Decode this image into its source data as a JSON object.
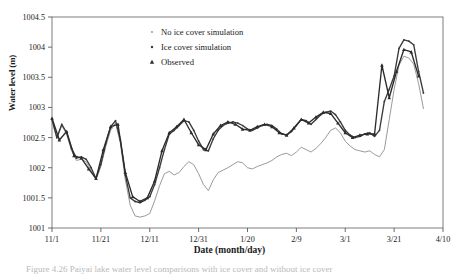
{
  "figure": {
    "caption": "Figure 4.26 Paiyai lake water level comparisons with ice cover and without ice cover"
  },
  "chart_data": {
    "type": "line",
    "title": "",
    "xlabel": "Date (month/day)",
    "ylabel": "Water level (m)",
    "ylim": [
      1001,
      1004.5
    ],
    "yticks": [
      1001,
      1001.5,
      1002,
      1002.5,
      1003,
      1003.5,
      1004,
      1004.5
    ],
    "ytick_labels": [
      "1001",
      "1001.5",
      "1002",
      "1002.5",
      "1003",
      "1003.5",
      "1004",
      "1004.5"
    ],
    "xlim": [
      0,
      160
    ],
    "xticks": [
      0,
      20,
      40,
      60,
      80,
      100,
      120,
      140,
      160
    ],
    "xtick_labels": [
      "11/1",
      "11/21",
      "12/11",
      "12/31",
      "1/20",
      "2/9",
      "3/1",
      "3/21",
      "4/10"
    ],
    "grid": false,
    "legend_position": "upper-center-left",
    "series": [
      {
        "name": "No ice cover simulation",
        "marker": "dot",
        "color": "#9a9a9a",
        "x": [
          0,
          2,
          4,
          6,
          8,
          10,
          12,
          14,
          16,
          18,
          20,
          22,
          24,
          26,
          28,
          30,
          32,
          34,
          36,
          38,
          40,
          42,
          44,
          46,
          48,
          50,
          52,
          54,
          56,
          58,
          60,
          62,
          64,
          66,
          68,
          70,
          72,
          74,
          76,
          78,
          80,
          82,
          84,
          86,
          88,
          90,
          92,
          94,
          96,
          98,
          100,
          102,
          104,
          106,
          108,
          110,
          112,
          114,
          116,
          118,
          120,
          122,
          124,
          126,
          128,
          130,
          132,
          134,
          136,
          138,
          140,
          142,
          144,
          146,
          148,
          150,
          152
        ],
        "values": [
          1002.78,
          1002.48,
          1002.7,
          1002.55,
          1002.28,
          1002.12,
          1002.14,
          1002.1,
          1001.95,
          1001.8,
          1002.02,
          1002.35,
          1002.62,
          1002.74,
          1002.4,
          1001.8,
          1001.38,
          1001.2,
          1001.18,
          1001.2,
          1001.24,
          1001.45,
          1001.7,
          1001.9,
          1001.94,
          1001.88,
          1001.92,
          1002.02,
          1002.1,
          1002.05,
          1001.9,
          1001.72,
          1001.62,
          1001.8,
          1001.92,
          1001.96,
          1002.0,
          1002.05,
          1002.1,
          1002.08,
          1002.0,
          1001.98,
          1002.02,
          1002.05,
          1002.08,
          1002.12,
          1002.18,
          1002.22,
          1002.24,
          1002.2,
          1002.26,
          1002.34,
          1002.3,
          1002.26,
          1002.32,
          1002.4,
          1002.5,
          1002.62,
          1002.66,
          1002.58,
          1002.44,
          1002.36,
          1002.3,
          1002.28,
          1002.26,
          1002.28,
          1002.22,
          1002.18,
          1002.3,
          1002.8,
          1003.3,
          1003.7,
          1003.85,
          1003.82,
          1003.72,
          1003.4,
          1002.98
        ]
      },
      {
        "name": "Ice cover simulation",
        "marker": "dot",
        "color": "#3a3a3a",
        "x": [
          0,
          2,
          4,
          6,
          8,
          10,
          12,
          14,
          16,
          18,
          20,
          22,
          24,
          26,
          28,
          30,
          32,
          34,
          36,
          38,
          40,
          42,
          44,
          46,
          48,
          50,
          52,
          54,
          56,
          58,
          60,
          62,
          64,
          66,
          68,
          70,
          72,
          74,
          76,
          78,
          80,
          82,
          84,
          86,
          88,
          90,
          92,
          94,
          96,
          98,
          100,
          102,
          104,
          106,
          108,
          110,
          112,
          114,
          116,
          118,
          120,
          122,
          124,
          126,
          128,
          130,
          132,
          134,
          136,
          138,
          140,
          142,
          144,
          146,
          148,
          150,
          152
        ],
        "values": [
          1002.8,
          1002.5,
          1002.72,
          1002.58,
          1002.32,
          1002.16,
          1002.18,
          1002.14,
          1002.0,
          1001.82,
          1002.06,
          1002.4,
          1002.68,
          1002.78,
          1002.46,
          1001.88,
          1001.5,
          1001.44,
          1001.42,
          1001.46,
          1001.52,
          1001.72,
          1002.0,
          1002.3,
          1002.56,
          1002.62,
          1002.7,
          1002.78,
          1002.76,
          1002.62,
          1002.44,
          1002.3,
          1002.28,
          1002.48,
          1002.62,
          1002.7,
          1002.74,
          1002.76,
          1002.74,
          1002.7,
          1002.64,
          1002.62,
          1002.66,
          1002.7,
          1002.72,
          1002.7,
          1002.64,
          1002.56,
          1002.54,
          1002.6,
          1002.7,
          1002.8,
          1002.78,
          1002.72,
          1002.8,
          1002.88,
          1002.92,
          1002.94,
          1002.88,
          1002.76,
          1002.62,
          1002.54,
          1002.5,
          1002.52,
          1002.56,
          1002.58,
          1002.52,
          1002.62,
          1003.1,
          1003.3,
          1003.52,
          1003.98,
          1004.12,
          1004.1,
          1004.04,
          1003.6,
          1003.24
        ]
      },
      {
        "name": "Observed",
        "marker": "triangle",
        "color": "#2b2b2b",
        "x": [
          0,
          3,
          6,
          9,
          12,
          15,
          18,
          21,
          24,
          27,
          30,
          33,
          36,
          39,
          42,
          45,
          48,
          51,
          54,
          57,
          60,
          63,
          66,
          69,
          72,
          75,
          78,
          81,
          84,
          87,
          90,
          93,
          96,
          99,
          102,
          105,
          108,
          111,
          114,
          117,
          120,
          123,
          126,
          129,
          132,
          135,
          138,
          141,
          144,
          147,
          150
        ],
        "values": [
          1002.82,
          1002.46,
          1002.6,
          1002.2,
          1002.16,
          1001.98,
          1001.82,
          1002.3,
          1002.68,
          1002.72,
          1001.92,
          1001.52,
          1001.44,
          1001.5,
          1001.78,
          1002.28,
          1002.58,
          1002.68,
          1002.8,
          1002.58,
          1002.38,
          1002.3,
          1002.56,
          1002.7,
          1002.76,
          1002.72,
          1002.64,
          1002.62,
          1002.68,
          1002.72,
          1002.68,
          1002.58,
          1002.54,
          1002.66,
          1002.8,
          1002.74,
          1002.84,
          1002.92,
          1002.9,
          1002.74,
          1002.58,
          1002.5,
          1002.54,
          1002.56,
          1002.56,
          1003.7,
          1003.16,
          1003.6,
          1003.96,
          1003.92,
          1003.52
        ]
      }
    ]
  }
}
